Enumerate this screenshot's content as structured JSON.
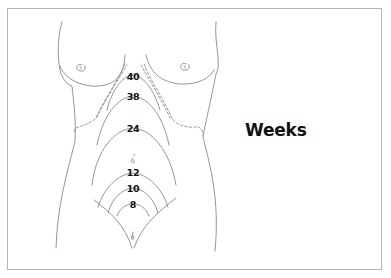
{
  "diagram": {
    "title": "Weeks",
    "colors": {
      "line": "#8a8a8a",
      "text": "#111111",
      "frame": "#b5b5b5"
    },
    "week_labels": [
      {
        "value": "40",
        "x": 133,
        "y": 72
      },
      {
        "value": "38",
        "x": 133,
        "y": 92
      },
      {
        "value": "24",
        "x": 133,
        "y": 124
      },
      {
        "value": "12",
        "x": 133,
        "y": 168
      },
      {
        "value": "10",
        "x": 133,
        "y": 184
      },
      {
        "value": "8",
        "x": 133,
        "y": 200
      }
    ],
    "landmarks": [
      "umbilicus-icon",
      "breast-left",
      "breast-right",
      "ribcage-margin-dashed",
      "pubic-symphysis"
    ]
  }
}
